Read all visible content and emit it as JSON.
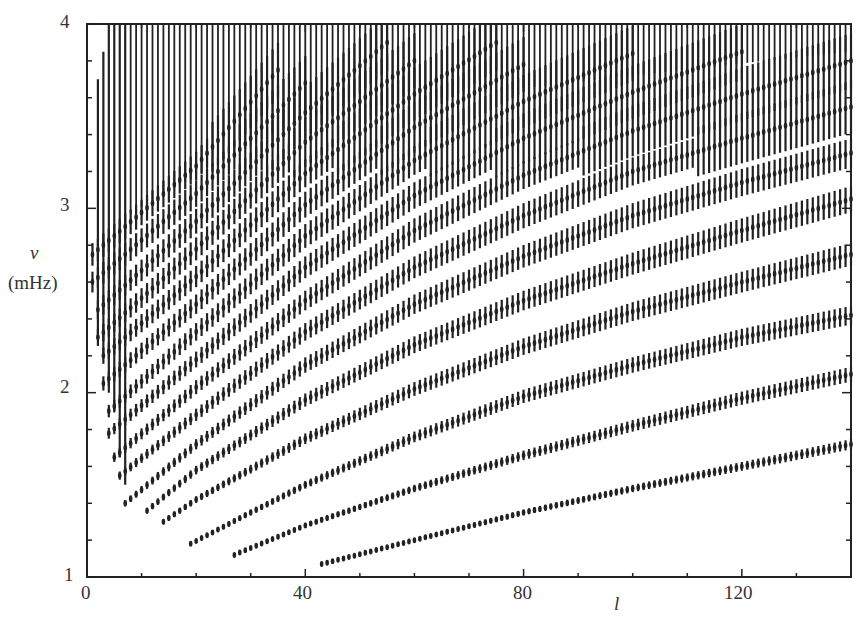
{
  "chart_data": {
    "type": "scatter",
    "title": "",
    "subtitle": "",
    "xlabel": "l",
    "ylabel": "ν (mHz)",
    "ylabel_symbol": "ν",
    "ylabel_unit": "(mHz)",
    "xlim": [
      0,
      140
    ],
    "ylim": [
      1,
      4
    ],
    "xticks": [
      0,
      40,
      80,
      120
    ],
    "xtick_labels": [
      "0",
      "40",
      "80",
      "120"
    ],
    "yticks": [
      1,
      2,
      3,
      4
    ],
    "ytick_labels": [
      "1",
      "2",
      "3",
      "4"
    ],
    "x_minor_tick_step": 10,
    "y_minor_tick_step": 0.2,
    "grid": false,
    "legend": null,
    "series": [
      {
        "name": "ridge-1",
        "l_start": 43,
        "x": [
          43,
          60,
          80,
          100,
          120,
          140
        ],
        "values": [
          1.07,
          1.2,
          1.35,
          1.48,
          1.6,
          1.72
        ]
      },
      {
        "name": "ridge-2",
        "l_start": 27,
        "x": [
          27,
          40,
          60,
          80,
          100,
          120,
          140
        ],
        "values": [
          1.12,
          1.28,
          1.48,
          1.66,
          1.82,
          1.97,
          2.1
        ]
      },
      {
        "name": "ridge-3",
        "l_start": 19,
        "x": [
          19,
          30,
          40,
          60,
          80,
          100,
          120,
          140
        ],
        "values": [
          1.18,
          1.35,
          1.5,
          1.76,
          1.98,
          2.15,
          2.3,
          2.42
        ]
      },
      {
        "name": "ridge-4",
        "l_start": 14,
        "x": [
          14,
          20,
          40,
          60,
          80,
          100,
          120,
          140
        ],
        "values": [
          1.3,
          1.42,
          1.75,
          2.02,
          2.25,
          2.44,
          2.6,
          2.75
        ]
      },
      {
        "name": "ridge-5",
        "l_start": 11,
        "x": [
          11,
          20,
          40,
          60,
          80,
          100,
          120,
          140
        ],
        "values": [
          1.36,
          1.58,
          1.96,
          2.26,
          2.5,
          2.7,
          2.88,
          3.05
        ]
      },
      {
        "name": "ridge-6",
        "l_start": 7,
        "x": [
          7,
          20,
          40,
          60,
          80,
          100,
          120,
          140
        ],
        "values": [
          1.4,
          1.72,
          2.15,
          2.48,
          2.74,
          2.96,
          3.14,
          3.3
        ]
      },
      {
        "name": "ridge-7",
        "l_start": 6,
        "x": [
          6,
          20,
          40,
          60,
          80,
          100,
          120,
          140
        ],
        "values": [
          1.55,
          1.88,
          2.33,
          2.68,
          2.96,
          3.2,
          3.38,
          3.55
        ]
      },
      {
        "name": "ridge-8",
        "l_start": 5,
        "x": [
          5,
          20,
          40,
          60,
          80,
          100,
          120,
          140
        ],
        "values": [
          1.65,
          2.03,
          2.5,
          2.88,
          3.18,
          3.42,
          3.62,
          3.8
        ]
      },
      {
        "name": "ridge-9",
        "l_start": 4,
        "x": [
          4,
          20,
          40,
          60,
          80,
          100,
          120
        ],
        "values": [
          1.78,
          2.18,
          2.68,
          3.07,
          3.38,
          3.63,
          3.85
        ]
      },
      {
        "name": "ridge-10",
        "l_start": 4,
        "x": [
          4,
          20,
          40,
          60,
          80,
          100
        ],
        "values": [
          1.9,
          2.33,
          2.85,
          3.26,
          3.58,
          3.84
        ]
      },
      {
        "name": "ridge-11",
        "l_start": 3,
        "x": [
          3,
          20,
          40,
          60,
          80
        ],
        "values": [
          2.05,
          2.48,
          3.02,
          3.44,
          3.78
        ]
      },
      {
        "name": "ridge-12",
        "l_start": 3,
        "x": [
          3,
          20,
          40,
          60,
          75
        ],
        "values": [
          2.2,
          2.63,
          3.19,
          3.62,
          3.9
        ]
      },
      {
        "name": "ridge-13",
        "l_start": 2,
        "x": [
          2,
          20,
          40,
          60
        ],
        "values": [
          2.3,
          2.78,
          3.36,
          3.8
        ]
      },
      {
        "name": "ridge-14",
        "l_start": 2,
        "x": [
          2,
          20,
          40,
          55
        ],
        "values": [
          2.45,
          2.93,
          3.52,
          3.9
        ]
      },
      {
        "name": "ridge-15",
        "l_start": 1,
        "x": [
          1,
          20,
          40
        ],
        "values": [
          2.6,
          3.08,
          3.68
        ]
      },
      {
        "name": "ridge-16",
        "l_start": 1,
        "x": [
          1,
          20,
          35
        ],
        "values": [
          2.75,
          3.23,
          3.75
        ]
      }
    ]
  }
}
